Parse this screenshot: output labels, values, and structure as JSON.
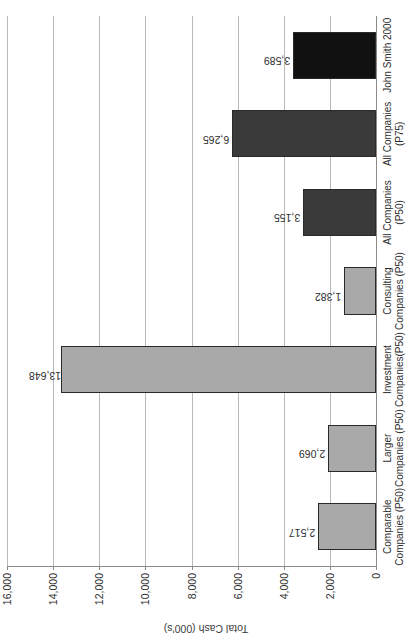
{
  "chart_data": {
    "type": "bar",
    "title": "",
    "xlabel": "",
    "ylabel": "Total Cash (000's)",
    "ylim": [
      0,
      16000
    ],
    "ytick_step": 2000,
    "yticks": [
      "0",
      "2,000",
      "4,000",
      "6,000",
      "8,000",
      "10,000",
      "12,000",
      "14,000",
      "16,000"
    ],
    "grid": true,
    "legend": "none",
    "orientation": "vertical-bars-image-rotated-90ccw",
    "categories": [
      "Comparable\nCompanies (P50)",
      "Larger\nCompanies (P50)",
      "Investment\nCompanies(P50)",
      "Consulting\nCompanies (P50)",
      "All Companies\n(P50)",
      "All Companies\n(P75)",
      "John Smith 2000"
    ],
    "values": [
      2517,
      2069,
      13648,
      1382,
      3155,
      6265,
      3589
    ],
    "value_labels": [
      "2,517",
      "2,069",
      "13,648",
      "1,382",
      "3,155",
      "6,265",
      "3,589"
    ],
    "bar_colors": [
      "#a9a9a9",
      "#a9a9a9",
      "#a9a9a9",
      "#a9a9a9",
      "#3a3a3a",
      "#3a3a3a",
      "#111111"
    ],
    "bar_edge_color": "#2a2a2a",
    "grid_color": "#b9b9b9",
    "axis_color": "#8a8a8a",
    "text_color": "#2e2e2e"
  }
}
